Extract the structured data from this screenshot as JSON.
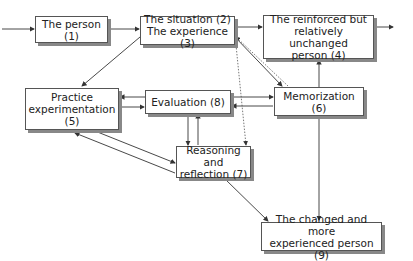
{
  "nodes": {
    "person": "The person (1)",
    "situation": "The situation (2)\nThe experience (3)",
    "reinforced": "The reinforced but\nrelatively unchanged\nperson (4)",
    "practice": "Practice\nexperimentation\n(5)",
    "evaluation": "Evaluation (8)",
    "memorization": "Memorization (6)",
    "reasoning": "Reasoning and\nreflection (7)",
    "changed": "The changed and more\nexperienced person (9)"
  },
  "colors": {
    "line": "#333333",
    "box_border": "#555555",
    "shadow": "#888888"
  }
}
